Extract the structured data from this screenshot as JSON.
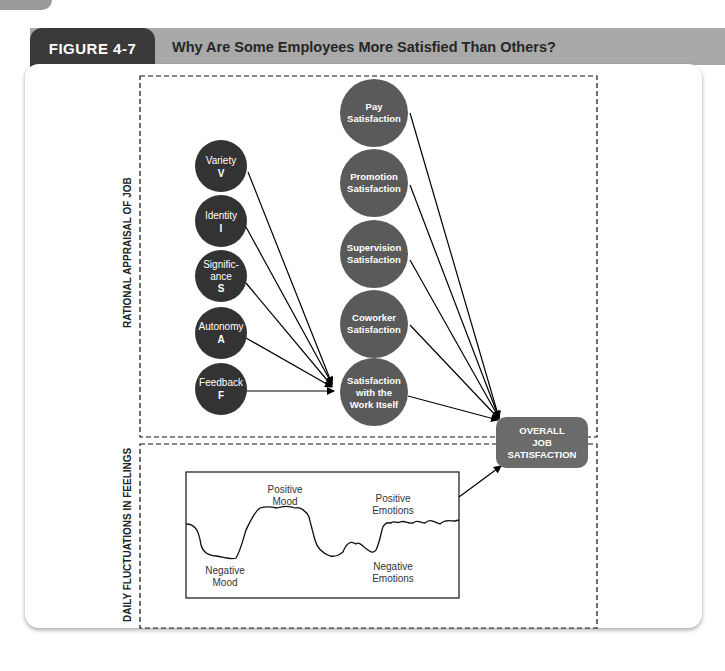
{
  "figure": {
    "number": "FIGURE 4-7",
    "title": "Why Are Some Employees More Satisfied Than Others?"
  },
  "sections": {
    "rational": "RATIONAL APPRAISAL OF JOB",
    "daily": "DAILY FLUCTUATIONS IN FEELINGS"
  },
  "job_characteristics": [
    {
      "name": "Variety",
      "letter": "V"
    },
    {
      "name": "Identity",
      "letter": "I"
    },
    {
      "name": "Signific-",
      "name2": "ance",
      "letter": "S"
    },
    {
      "name": "Autonomy",
      "letter": "A"
    },
    {
      "name": "Feedback",
      "letter": "F"
    }
  ],
  "satisfaction_facets": [
    {
      "line1": "Pay",
      "line2": "Satisfaction"
    },
    {
      "line1": "Promotion",
      "line2": "Satisfaction"
    },
    {
      "line1": "Supervision",
      "line2": "Satisfaction"
    },
    {
      "line1": "Coworker",
      "line2": "Satisfaction"
    },
    {
      "line1": "Satisfaction",
      "line2": "with the",
      "line3": "Work Itself"
    }
  ],
  "outcome": {
    "line1": "OVERALL",
    "line2": "JOB",
    "line3": "SATISFACTION"
  },
  "feelings_chart": {
    "labels": {
      "positive_mood": [
        "Positive",
        "Mood"
      ],
      "negative_mood": [
        "Negative",
        "Mood"
      ],
      "positive_emotions": [
        "Positive",
        "Emotions"
      ],
      "negative_emotions": [
        "Negative",
        "Emotions"
      ]
    }
  },
  "colors": {
    "dark_circle": "#333333",
    "facet_circle": "#5a5a5a",
    "outcome_box": "#6b6b6b",
    "header_bar": "#a9a9a9",
    "figure_tab": "#3a3a3a"
  }
}
